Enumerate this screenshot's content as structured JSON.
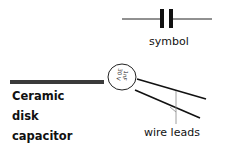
{
  "title": {
    "lines": [
      "Ceramic",
      "disk",
      "capacitor"
    ]
  },
  "labels": {
    "symbol": "symbol",
    "wire_leads": "wire leads",
    "disk_marking_line1": "1nF",
    "disk_marking_line2": "30 V"
  },
  "colors": {
    "ink": "#111111",
    "bar": "#3a3a3a",
    "leader": "#888888"
  }
}
